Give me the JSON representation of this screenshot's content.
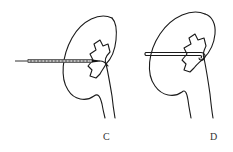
{
  "figure": {
    "panels": [
      {
        "id": "C",
        "label": "C",
        "instrument": "needle",
        "description": "Needle puncture into renal pelvis"
      },
      {
        "id": "D",
        "label": "D",
        "instrument": "catheter",
        "description": "Pigtail catheter placed in renal pelvis"
      }
    ],
    "colors": {
      "line": "#1a1a1a",
      "background": "#ffffff"
    }
  }
}
